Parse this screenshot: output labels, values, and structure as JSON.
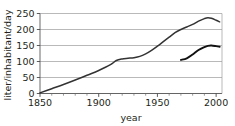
{
  "chart_data": {
    "type": "line",
    "title": "",
    "xlabel": "year",
    "ylabel": "liter/inhabitant/day",
    "xlim": [
      1850,
      2005
    ],
    "ylim": [
      0,
      250
    ],
    "grid": true,
    "grid_axis": "y",
    "legend": "none",
    "x_ticks": [
      1850,
      1900,
      1950,
      2000
    ],
    "x_tick_labels": [
      "1850",
      "1900",
      "1950",
      "2000"
    ],
    "x_minor_tick_step": 10,
    "y_ticks": [
      0,
      50,
      100,
      150,
      200,
      250
    ],
    "y_tick_labels": [
      "0",
      "50",
      "100",
      "150",
      "200",
      "250"
    ],
    "series": [
      {
        "name": "total water consumption",
        "color": "#333333",
        "x": [
          1850,
          1860,
          1870,
          1880,
          1890,
          1900,
          1910,
          1915,
          1920,
          1925,
          1930,
          1935,
          1940,
          1945,
          1950,
          1955,
          1960,
          1965,
          1970,
          1975,
          1980,
          1985,
          1990,
          1993,
          1996,
          2000,
          2003
        ],
        "y": [
          2,
          15,
          28,
          42,
          57,
          72,
          90,
          103,
          108,
          110,
          112,
          116,
          124,
          135,
          148,
          162,
          176,
          190,
          200,
          208,
          216,
          226,
          234,
          237,
          235,
          229,
          224
        ]
      },
      {
        "name": "household water consumption",
        "color": "#111111",
        "x": [
          1970,
          1975,
          1980,
          1985,
          1990,
          1993,
          1996,
          2000,
          2003
        ],
        "y": [
          105,
          110,
          122,
          136,
          145,
          149,
          150,
          148,
          146
        ]
      }
    ]
  },
  "axes": {
    "y_axis_label": "liter/inhabitant/day",
    "x_axis_label": "year"
  }
}
